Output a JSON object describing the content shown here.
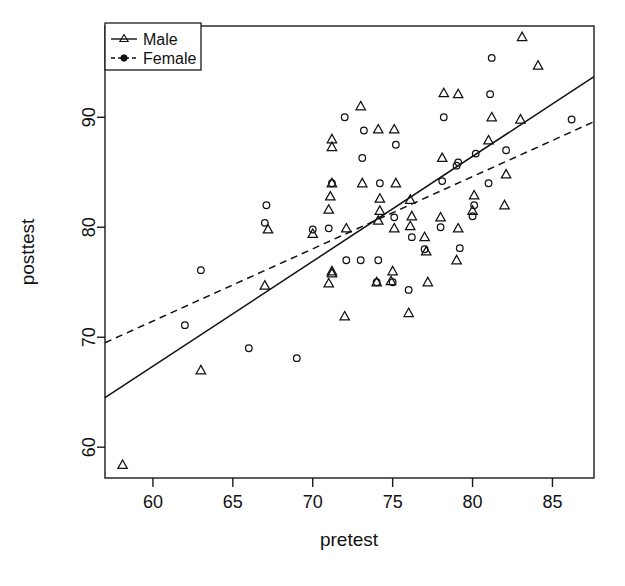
{
  "chart_data": {
    "type": "scatter",
    "title": "",
    "xlabel": "pretest",
    "ylabel": "posttest",
    "xlim": [
      57.0,
      87.6
    ],
    "ylim": [
      57.2,
      98.3
    ],
    "xticks": [
      60,
      65,
      70,
      75,
      80,
      85
    ],
    "yticks": [
      60,
      70,
      80,
      90
    ],
    "xtick_labels": [
      "60",
      "65",
      "70",
      "75",
      "80",
      "85"
    ],
    "ytick_labels": [
      "60",
      "70",
      "80",
      "90"
    ],
    "grid": false,
    "legend_position": "top-left",
    "legend": [
      {
        "name": "Male",
        "marker": "triangle",
        "linestyle": "solid"
      },
      {
        "name": "Female",
        "marker": "circle",
        "linestyle": "dashed"
      }
    ],
    "series": [
      {
        "name": "Male",
        "marker": "triangle",
        "linestyle": "solid",
        "color": "#111111",
        "points": [
          [
            58.1,
            58.4
          ],
          [
            63.0,
            67.0
          ],
          [
            67.0,
            74.7
          ],
          [
            67.2,
            79.8
          ],
          [
            70.0,
            79.4
          ],
          [
            71.0,
            74.9
          ],
          [
            71.2,
            75.8
          ],
          [
            71.2,
            76.0
          ],
          [
            71.0,
            81.6
          ],
          [
            71.1,
            82.8
          ],
          [
            71.2,
            84.0
          ],
          [
            71.2,
            87.3
          ],
          [
            71.2,
            88.0
          ],
          [
            72.0,
            71.9
          ],
          [
            72.1,
            79.9
          ],
          [
            73.0,
            91.0
          ],
          [
            73.1,
            84.0
          ],
          [
            74.0,
            75.0
          ],
          [
            74.1,
            80.6
          ],
          [
            74.2,
            81.5
          ],
          [
            74.2,
            82.6
          ],
          [
            74.1,
            88.9
          ],
          [
            74.9,
            75.1
          ],
          [
            75.0,
            76.0
          ],
          [
            75.1,
            79.9
          ],
          [
            75.2,
            84.0
          ],
          [
            75.1,
            88.9
          ],
          [
            76.0,
            72.2
          ],
          [
            76.1,
            80.1
          ],
          [
            76.2,
            81.0
          ],
          [
            76.1,
            82.5
          ],
          [
            77.0,
            79.1
          ],
          [
            77.2,
            75.0
          ],
          [
            77.1,
            77.8
          ],
          [
            78.0,
            80.9
          ],
          [
            78.1,
            86.3
          ],
          [
            78.2,
            92.2
          ],
          [
            79.0,
            77.0
          ],
          [
            79.1,
            79.9
          ],
          [
            79.1,
            92.1
          ],
          [
            80.0,
            81.5
          ],
          [
            80.1,
            82.9
          ],
          [
            81.0,
            87.9
          ],
          [
            81.2,
            90.0
          ],
          [
            82.0,
            82.0
          ],
          [
            82.1,
            84.8
          ],
          [
            83.0,
            89.8
          ],
          [
            83.1,
            97.3
          ],
          [
            84.1,
            94.7
          ]
        ]
      },
      {
        "name": "Female",
        "marker": "circle",
        "linestyle": "dashed",
        "color": "#111111",
        "points": [
          [
            62.0,
            71.1
          ],
          [
            63.0,
            76.1
          ],
          [
            66.0,
            69.0
          ],
          [
            67.0,
            80.4
          ],
          [
            67.1,
            82.0
          ],
          [
            69.0,
            68.1
          ],
          [
            70.0,
            79.8
          ],
          [
            71.0,
            79.9
          ],
          [
            71.2,
            84.0
          ],
          [
            72.0,
            90.0
          ],
          [
            72.1,
            77.0
          ],
          [
            73.0,
            77.0
          ],
          [
            73.1,
            86.3
          ],
          [
            73.2,
            88.8
          ],
          [
            74.0,
            75.0
          ],
          [
            74.1,
            77.0
          ],
          [
            74.2,
            84.0
          ],
          [
            75.0,
            75.0
          ],
          [
            75.1,
            80.9
          ],
          [
            75.2,
            87.5
          ],
          [
            76.0,
            74.3
          ],
          [
            76.2,
            79.1
          ],
          [
            77.0,
            78.0
          ],
          [
            78.0,
            80.0
          ],
          [
            78.1,
            84.2
          ],
          [
            78.2,
            90.0
          ],
          [
            79.0,
            85.6
          ],
          [
            79.1,
            85.9
          ],
          [
            79.2,
            78.1
          ],
          [
            80.0,
            81.0
          ],
          [
            80.1,
            82.0
          ],
          [
            80.2,
            86.7
          ],
          [
            81.0,
            84.0
          ],
          [
            81.1,
            92.1
          ],
          [
            81.2,
            95.4
          ],
          [
            82.1,
            87.0
          ],
          [
            86.2,
            89.8
          ]
        ]
      }
    ],
    "fit_lines": [
      {
        "name": "Male",
        "linestyle": "solid",
        "x": [
          57.0,
          87.6
        ],
        "y": [
          64.5,
          93.7
        ]
      },
      {
        "name": "Female",
        "linestyle": "dashed",
        "x": [
          57.0,
          87.6
        ],
        "y": [
          69.5,
          89.6
        ]
      }
    ]
  }
}
